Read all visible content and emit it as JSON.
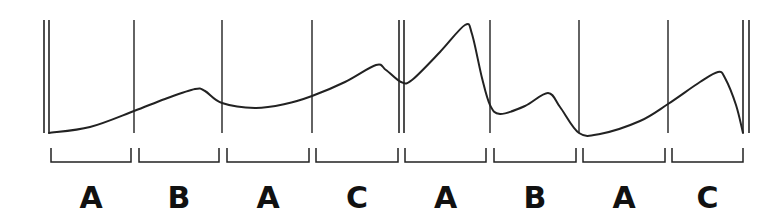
{
  "diagram": {
    "title": "",
    "stroke_color": "#222222",
    "label_color": "#111111",
    "boundaries": {
      "double_bars": [
        {
          "x1": 44,
          "x2": 49
        },
        {
          "x1": 399,
          "x2": 404
        },
        {
          "x1": 743,
          "x2": 749
        }
      ],
      "single_bars": [
        134,
        222,
        312,
        490,
        579,
        668
      ],
      "top": 20,
      "bottom": 133
    },
    "curve_points": [
      [
        49,
        133
      ],
      [
        90,
        127
      ],
      [
        134,
        111
      ],
      [
        165,
        99
      ],
      [
        195,
        89
      ],
      [
        205,
        91
      ],
      [
        222,
        103
      ],
      [
        255,
        108
      ],
      [
        285,
        104
      ],
      [
        312,
        96
      ],
      [
        345,
        82
      ],
      [
        376,
        65
      ],
      [
        386,
        70
      ],
      [
        401,
        82
      ],
      [
        412,
        80
      ],
      [
        440,
        52
      ],
      [
        465,
        25
      ],
      [
        472,
        34
      ],
      [
        482,
        78
      ],
      [
        490,
        105
      ],
      [
        500,
        114
      ],
      [
        525,
        106
      ],
      [
        548,
        93
      ],
      [
        560,
        107
      ],
      [
        579,
        133
      ],
      [
        600,
        134
      ],
      [
        640,
        121
      ],
      [
        668,
        104
      ],
      [
        700,
        82
      ],
      [
        718,
        72
      ],
      [
        725,
        78
      ],
      [
        736,
        105
      ],
      [
        743,
        133
      ]
    ],
    "segments": [
      {
        "label": "A",
        "bracket_x1": 51,
        "bracket_x2": 131
      },
      {
        "label": "B",
        "bracket_x1": 139,
        "bracket_x2": 219
      },
      {
        "label": "A",
        "bracket_x1": 227,
        "bracket_x2": 309
      },
      {
        "label": "C",
        "bracket_x1": 316,
        "bracket_x2": 398
      },
      {
        "label": "A",
        "bracket_x1": 405,
        "bracket_x2": 486
      },
      {
        "label": "B",
        "bracket_x1": 494,
        "bracket_x2": 576
      },
      {
        "label": "A",
        "bracket_x1": 583,
        "bracket_x2": 665
      },
      {
        "label": "C",
        "bracket_x1": 672,
        "bracket_x2": 743
      }
    ],
    "bracket_top": 148,
    "bracket_bottom": 162,
    "label_baseline": 208
  }
}
